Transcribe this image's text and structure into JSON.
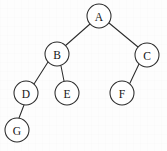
{
  "figure": {
    "kind": "binary-tree-diagram",
    "width": 167,
    "height": 151,
    "background_color": "#fdfdfd",
    "stroke_color": "#2b2b2b",
    "label_color": "#141414",
    "node_fill_color": "#ffffff",
    "node_radius": 12
  },
  "nodes": [
    {
      "id": "A",
      "label": "A",
      "cx": 99,
      "cy": 16,
      "r": 12
    },
    {
      "id": "B",
      "label": "B",
      "cx": 57,
      "cy": 54,
      "r": 12
    },
    {
      "id": "C",
      "label": "C",
      "cx": 147,
      "cy": 55,
      "r": 12
    },
    {
      "id": "D",
      "label": "D",
      "cx": 26,
      "cy": 93,
      "r": 12
    },
    {
      "id": "E",
      "label": "E",
      "cx": 67,
      "cy": 93,
      "r": 12
    },
    {
      "id": "F",
      "label": "F",
      "cx": 122,
      "cy": 93,
      "r": 12
    },
    {
      "id": "G",
      "label": "G",
      "cx": 17,
      "cy": 130,
      "r": 12
    }
  ],
  "edges": [
    {
      "from": "A",
      "to": "B",
      "x1": 90,
      "y1": 24,
      "x2": 65,
      "y2": 46
    },
    {
      "from": "A",
      "to": "C",
      "x1": 109,
      "y1": 23,
      "x2": 138,
      "y2": 47
    },
    {
      "from": "B",
      "to": "D",
      "x1": 48,
      "y1": 62,
      "x2": 34,
      "y2": 84
    },
    {
      "from": "B",
      "to": "E",
      "x1": 61,
      "y1": 66,
      "x2": 64,
      "y2": 81
    },
    {
      "from": "C",
      "to": "F",
      "x1": 139,
      "y1": 64,
      "x2": 130,
      "y2": 83
    },
    {
      "from": "D",
      "to": "G",
      "x1": 24,
      "y1": 105,
      "x2": 19,
      "y2": 118
    }
  ]
}
